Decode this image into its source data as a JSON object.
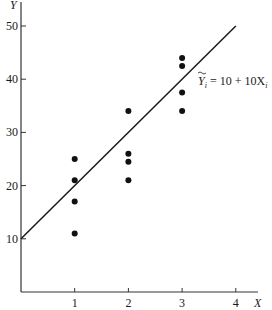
{
  "chart_data": {
    "type": "scatter",
    "title": "",
    "xlabel": "X",
    "ylabel": "Y",
    "xlim": [
      0,
      4.3
    ],
    "ylim": [
      0,
      53
    ],
    "grid": false,
    "x_ticks": [
      1,
      2,
      3,
      4
    ],
    "y_ticks": [
      10,
      20,
      30,
      40,
      50
    ],
    "series": [
      {
        "name": "observations",
        "type": "scatter",
        "points": [
          {
            "x": 1,
            "y": 25
          },
          {
            "x": 1,
            "y": 21
          },
          {
            "x": 1,
            "y": 17
          },
          {
            "x": 1,
            "y": 11
          },
          {
            "x": 2,
            "y": 34
          },
          {
            "x": 2,
            "y": 26
          },
          {
            "x": 2,
            "y": 24.5
          },
          {
            "x": 2,
            "y": 21
          },
          {
            "x": 3,
            "y": 44
          },
          {
            "x": 3,
            "y": 42.5
          },
          {
            "x": 3,
            "y": 37.5
          },
          {
            "x": 3,
            "y": 34
          }
        ]
      },
      {
        "name": "fitted line",
        "type": "line",
        "points": [
          {
            "x": 0,
            "y": 10
          },
          {
            "x": 4,
            "y": 50
          }
        ]
      }
    ],
    "annotations": [
      {
        "text": "Ỹi = 10 + 10Xi",
        "x": 3.4,
        "y": 40
      }
    ]
  },
  "labels": {
    "x_axis": "X",
    "y_axis": "Y",
    "equation_lhs": "Y",
    "equation_sub": "i",
    "equation_rhs": " = 10 + 10X",
    "equation_rhs_sub": "i",
    "x_tick_labels": [
      "1",
      "2",
      "3",
      "4"
    ],
    "y_tick_labels": [
      "10",
      "20",
      "30",
      "40",
      "50"
    ]
  }
}
